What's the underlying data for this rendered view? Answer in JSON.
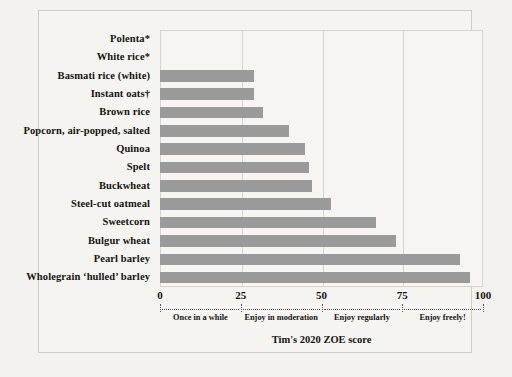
{
  "chart_data": {
    "type": "bar",
    "orientation": "horizontal",
    "title": "",
    "xlabel": "Tim's 2020 ZOE score",
    "ylabel": "",
    "xlim": [
      0,
      100
    ],
    "xticks": [
      0,
      25,
      50,
      75,
      100
    ],
    "xtick_labels": [
      "0",
      "25",
      "50",
      "75",
      "100"
    ],
    "grid": true,
    "grid_axis": "x",
    "legend": "none",
    "bar_color": "#9a9a9a",
    "background_color": "#f6f4f1",
    "categories": [
      "Polenta*",
      "White rice*",
      "Basmati rice (white)",
      "Instant oats†",
      "Brown rice",
      "Popcorn, air-popped, salted",
      "Quinoa",
      "Spelt",
      "Buckwheat",
      "Steel-cut oatmeal",
      "Sweetcorn",
      "Bulgur wheat",
      "Pearl barley",
      "Wholegrain ‘hulled’ barley"
    ],
    "values": [
      0,
      0,
      29,
      29,
      32,
      40,
      45,
      46,
      47,
      53,
      67,
      73,
      93,
      96
    ],
    "annotations": {
      "zones": [
        {
          "label": "Once in a while",
          "start": 0,
          "end": 25,
          "center": 12.5
        },
        {
          "label": "Enjoy in moderation",
          "start": 25,
          "end": 50,
          "center": 37.5
        },
        {
          "label": "Enjoy regularly",
          "start": 50,
          "end": 75,
          "center": 62.5
        },
        {
          "label": "Enjoy freely!",
          "start": 75,
          "end": 100,
          "center": 87.5
        }
      ]
    }
  }
}
